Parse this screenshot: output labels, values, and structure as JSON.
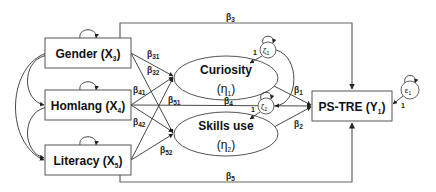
{
  "diagram": {
    "type": "structural-equation-model",
    "exogenous": [
      {
        "id": "gender",
        "name": "Gender (X",
        "sub": "3",
        "close": ")"
      },
      {
        "id": "homlang",
        "name": "Homlang (X",
        "sub": "4",
        "close": ")"
      },
      {
        "id": "literacy",
        "name": "Literacy (X",
        "sub": "5",
        "close": ")"
      }
    ],
    "mediators": [
      {
        "id": "curiosity",
        "name": "Curiosity",
        "symbol": "(η",
        "sub": "1",
        "close": ")",
        "error": "ζ",
        "error_sub": "1"
      },
      {
        "id": "skills",
        "name": "Skills use",
        "symbol": "(η",
        "sub": "2",
        "close": ")",
        "error": "ζ",
        "error_sub": "2"
      }
    ],
    "outcome": {
      "id": "pstre",
      "name": "PS-TRE (Y",
      "sub": "1",
      "close": ")",
      "error": "ε",
      "error_sub": "1"
    },
    "paths": {
      "b31": {
        "base": "β",
        "sub": "31"
      },
      "b32": {
        "base": "β",
        "sub": "32"
      },
      "b41": {
        "base": "β",
        "sub": "41"
      },
      "b42": {
        "base": "β",
        "sub": "42"
      },
      "b51": {
        "base": "β",
        "sub": "51"
      },
      "b52": {
        "base": "β",
        "sub": "52"
      },
      "b1": {
        "base": "β",
        "sub": "1"
      },
      "b2": {
        "base": "β",
        "sub": "2"
      },
      "b3": {
        "base": "β",
        "sub": "3"
      },
      "b4": {
        "base": "β",
        "sub": "4"
      },
      "b5": {
        "base": "β",
        "sub": "5"
      }
    },
    "error_loading": "1"
  }
}
